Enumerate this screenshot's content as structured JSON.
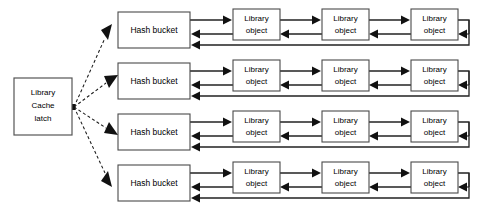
{
  "diagram": {
    "background_color": "#ffffff",
    "line_color": "#222222",
    "box_border_color": "#4a4a4a",
    "box_fill_color": "#ffffff",
    "text_color": "#000000"
  },
  "latch": {
    "name": "library-cache-latch",
    "line1": "Library",
    "line2": "Cache",
    "line3": "latch",
    "x": 14,
    "y": 78,
    "width": 58,
    "height": 57
  },
  "buckets": [
    {
      "label": "Hash bucket",
      "x": 118,
      "y": 12,
      "width": 72,
      "height": 36
    },
    {
      "label": "Hash bucket",
      "x": 118,
      "y": 63,
      "width": 72,
      "height": 36
    },
    {
      "label": "Hash bucket",
      "x": 118,
      "y": 114,
      "width": 72,
      "height": 36
    },
    {
      "label": "Hash bucket",
      "x": 118,
      "y": 165,
      "width": 72,
      "height": 36
    }
  ],
  "objects": {
    "line1": "Library",
    "line2": "object",
    "width": 47,
    "height": 31,
    "columns_x": [
      233,
      322,
      411
    ],
    "rows_y": [
      9,
      60,
      111,
      162
    ]
  },
  "connections": {
    "latch_to_bucket": "dashed-arrow",
    "bucket_to_object": "arrow-right",
    "object_to_bucket": "arrow-left",
    "tail_wrap": "arrow-left-return",
    "count_rows": 4,
    "count_objects_per_row": 3
  }
}
